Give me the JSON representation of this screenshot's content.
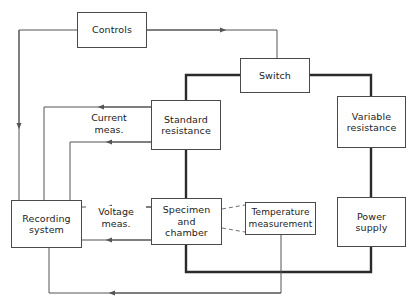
{
  "diagram": {
    "canvas": {
      "width": 416,
      "height": 307,
      "background": "#ffffff"
    },
    "colors": {
      "box_stroke": "#4a4a4a",
      "thin_wire": "#555555",
      "thick_wire": "#2b2b2b",
      "dashed_wire": "#707070",
      "text": "#1c1c1c"
    },
    "nodes": [
      {
        "id": "controls",
        "label": "Controls",
        "x": 77,
        "y": 12,
        "w": 70,
        "h": 36
      },
      {
        "id": "switch",
        "label": "Switch",
        "x": 240,
        "y": 58,
        "w": 70,
        "h": 35
      },
      {
        "id": "standard_res",
        "label": "Standard\nresistance",
        "x": 151,
        "y": 100,
        "w": 70,
        "h": 50
      },
      {
        "id": "variable_res",
        "label": "Variable\nresistance",
        "x": 337,
        "y": 96,
        "w": 69,
        "h": 52
      },
      {
        "id": "recording",
        "label": "Recording\nsystem",
        "x": 11,
        "y": 200,
        "w": 71,
        "h": 48
      },
      {
        "id": "specimen",
        "label": "Specimen\nand\nchamber",
        "x": 151,
        "y": 198,
        "w": 71,
        "h": 47
      },
      {
        "id": "temperature",
        "label": "Temperature\nmeasurement",
        "x": 245,
        "y": 202,
        "w": 71,
        "h": 33
      },
      {
        "id": "power",
        "label": "Power\nsupply",
        "x": 337,
        "y": 197,
        "w": 69,
        "h": 50
      }
    ],
    "edge_labels": [
      {
        "id": "current_meas",
        "label": "Current\nmeas.",
        "x": 75,
        "y": 112,
        "w": 68
      },
      {
        "id": "voltage_meas",
        "label": "Voltage\nmeas.",
        "x": 86,
        "y": 206,
        "w": 60
      }
    ],
    "connections": [
      {
        "id": "controls-to-switch",
        "from": "controls",
        "to": "switch",
        "style": "thin",
        "arrow": true
      },
      {
        "id": "controls-to-recording",
        "from": "controls",
        "to": "recording",
        "style": "thin",
        "arrow": true
      },
      {
        "id": "switch-to-standard",
        "from": "switch",
        "to": "standard_res",
        "style": "thick",
        "arrow": false
      },
      {
        "id": "switch-to-variable",
        "from": "switch",
        "to": "variable_res",
        "style": "thick",
        "arrow": false
      },
      {
        "id": "variable-to-power",
        "from": "variable_res",
        "to": "power",
        "style": "thick",
        "arrow": false
      },
      {
        "id": "standard-to-specimen",
        "from": "standard_res",
        "to": "specimen",
        "style": "thick",
        "arrow": false
      },
      {
        "id": "specimen-to-power",
        "from": "specimen",
        "to": "power",
        "style": "thick",
        "arrow": false
      },
      {
        "id": "standard-current-upper",
        "from": "standard_res",
        "to": "recording",
        "style": "thin",
        "arrow": true
      },
      {
        "id": "standard-current-lower",
        "from": "standard_res",
        "to": "recording",
        "style": "thin",
        "arrow": true
      },
      {
        "id": "specimen-voltage-upper",
        "from": "specimen",
        "to": "recording",
        "style": "thin",
        "arrow": true
      },
      {
        "id": "specimen-voltage-lower",
        "from": "specimen",
        "to": "recording",
        "style": "thin",
        "arrow": true
      },
      {
        "id": "specimen-to-temperature-top",
        "from": "specimen",
        "to": "temperature",
        "style": "dashed",
        "arrow": false
      },
      {
        "id": "specimen-to-temperature-bot",
        "from": "specimen",
        "to": "temperature",
        "style": "dashed",
        "arrow": false
      },
      {
        "id": "temperature-to-recording",
        "from": "temperature",
        "to": "recording",
        "style": "thin",
        "arrow": true
      }
    ]
  }
}
